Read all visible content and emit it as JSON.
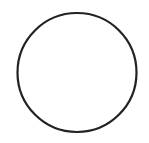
{
  "shape": {
    "type": "circle",
    "cx": 77,
    "cy": 72.5,
    "r": 59.5,
    "stroke": "#222222",
    "stroke_width": 2.2,
    "fill": "#ffffff"
  },
  "background": "#ffffff"
}
